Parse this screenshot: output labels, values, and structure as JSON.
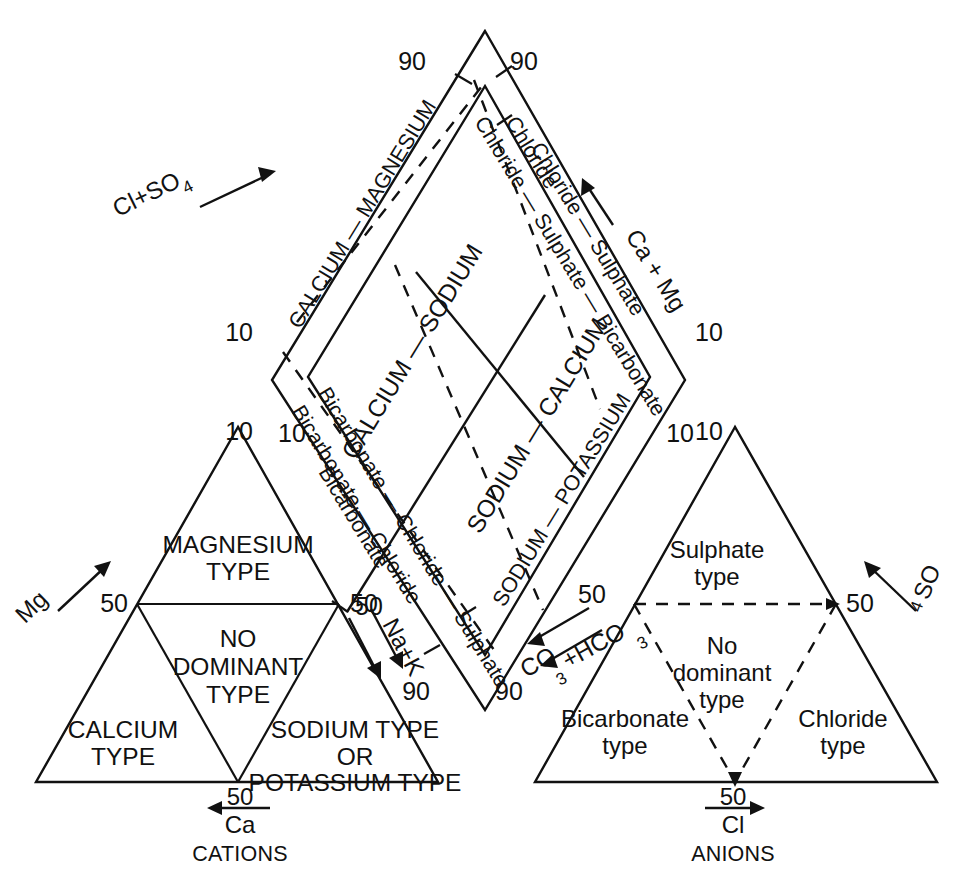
{
  "figure": {
    "type": "piper-trilinear-diagram"
  },
  "cation_triangle": {
    "caption": "CATIONS",
    "left_axis_label": "Mg",
    "bottom_axis_label": "Ca",
    "bottom_axis_value": "50",
    "tick_left": "50",
    "tick_right": "50",
    "tick_apex_right": "10",
    "zones": [
      {
        "id": "magnesium",
        "lines": [
          "MAGNESIUM",
          "TYPE"
        ]
      },
      {
        "id": "no-dominant",
        "lines": [
          "NO",
          "DOMINANT",
          "TYPE"
        ]
      },
      {
        "id": "calcium",
        "lines": [
          "CALCIUM",
          "TYPE"
        ]
      },
      {
        "id": "sodium-potassium",
        "lines": [
          "SODIUM TYPE",
          "OR",
          "POTASSIUM TYPE"
        ]
      }
    ]
  },
  "anion_triangle": {
    "caption": "ANIONS",
    "right_axis_label": "SO",
    "right_axis_sub": "4",
    "bottom_axis_label": "Cl",
    "bottom_axis_value": "50",
    "tick_right": "50",
    "tick_apex_left": "10",
    "zones": [
      {
        "id": "sulphate",
        "lines": [
          "Sulphate",
          "type"
        ]
      },
      {
        "id": "no-dominant",
        "lines": [
          "No",
          "dominant",
          "type"
        ]
      },
      {
        "id": "bicarbonate",
        "lines": [
          "Bicarbonate",
          "type"
        ]
      },
      {
        "id": "chloride",
        "lines": [
          "Chloride",
          "type"
        ]
      }
    ]
  },
  "diamond": {
    "ticks": {
      "top_left": "90",
      "top_right": "90",
      "upper_left": "10",
      "lower_left": "10",
      "upper_right": "10",
      "lower_right": "10",
      "left_50": "50",
      "right_50": "50",
      "bottom_left": "90",
      "bottom_right": "90"
    },
    "axes": [
      {
        "id": "cl-so4",
        "label": "Cl+SO",
        "sub": "4",
        "direction": "up-right"
      },
      {
        "id": "ca-mg",
        "label": "Ca + Mg",
        "sub": "",
        "direction": "up-right"
      },
      {
        "id": "na-k",
        "label": "Na+K",
        "sub": "",
        "direction": "down-right"
      },
      {
        "id": "co3-hco3",
        "label": "CO",
        "sub": "3",
        "label2": "+HCO",
        "sub2": "3",
        "direction": "down-left"
      }
    ],
    "outer_bands": {
      "upper_left": "CALCIUM — MAGNESIUM",
      "upper_right_1": "Chloride",
      "upper_right_2": "Chloride — Sulphate",
      "upper_right_3": "Chloride — Sulphate — Bicarbonate",
      "lower_left_1": "Bicarbonate",
      "lower_left_2": "Bicarbonate — Chloride",
      "lower_left_3": "Bicarbonate — Chloride — Sulphate",
      "lower_right": "SODIUM — POTASSIUM"
    },
    "inner_zones": [
      {
        "id": "calcium-sodium",
        "label": "CALCIUM — SODIUM"
      },
      {
        "id": "sodium-calcium",
        "label": "SODIUM — CALCIUM"
      }
    ]
  },
  "colors": {
    "ink": "#111111",
    "background": "#ffffff"
  }
}
